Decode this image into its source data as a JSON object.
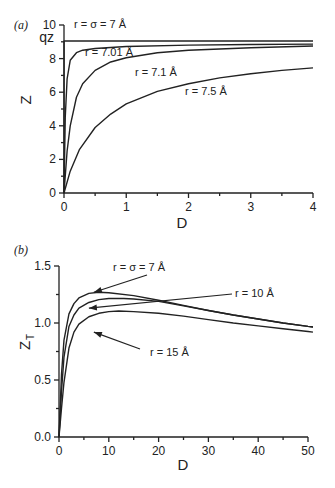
{
  "chart_data": [
    {
      "type": "line",
      "panel_label": "(a)",
      "title": "",
      "xlabel": "D",
      "ylabel": "Z",
      "xlim": [
        0,
        4
      ],
      "ylim": [
        0,
        10
      ],
      "xticks": [
        "0",
        "1",
        "2",
        "3",
        "4"
      ],
      "yticks": [
        "0",
        "2",
        "4",
        "6",
        "8",
        "10"
      ],
      "extra_ytick": {
        "label": "qz",
        "value": 9.05
      },
      "grid": false,
      "series": [
        {
          "name": "r = σ = 7 Å",
          "x": [
            0,
            0.001,
            4
          ],
          "y": [
            0,
            9.05,
            9.05
          ]
        },
        {
          "name": "r = 7.01 Å",
          "x": [
            0,
            0.02,
            0.05,
            0.1,
            0.2,
            0.3,
            0.5,
            1,
            2,
            3,
            4
          ],
          "y": [
            0,
            4.5,
            6.8,
            7.9,
            8.35,
            8.5,
            8.6,
            8.72,
            8.8,
            8.84,
            8.86
          ]
        },
        {
          "name": "r = 7.1 Å",
          "x": [
            0,
            0.05,
            0.1,
            0.2,
            0.3,
            0.5,
            0.75,
            1,
            1.5,
            2,
            3,
            4
          ],
          "y": [
            0,
            2.5,
            4.0,
            5.7,
            6.5,
            7.3,
            7.8,
            8.05,
            8.35,
            8.5,
            8.65,
            8.75
          ]
        },
        {
          "name": "r = 7.5 Å",
          "x": [
            0,
            0.1,
            0.25,
            0.5,
            0.75,
            1,
            1.5,
            2,
            2.5,
            3,
            3.5,
            4
          ],
          "y": [
            0,
            1.3,
            2.6,
            3.9,
            4.7,
            5.3,
            6.05,
            6.5,
            6.85,
            7.1,
            7.3,
            7.45
          ]
        }
      ],
      "annotations": [
        {
          "text": "r = σ = 7 Å",
          "series": 0
        },
        {
          "text": "r = 7.01 Å",
          "series": 1
        },
        {
          "text": "r = 7.1 Å",
          "series": 2
        },
        {
          "text": "r = 7.5 Å",
          "series": 3
        }
      ]
    },
    {
      "type": "line",
      "panel_label": "(b)",
      "title": "",
      "xlabel": "D",
      "ylabel": "Z_T",
      "ylabel_main": "Z",
      "ylabel_sub": "T",
      "xlim": [
        0,
        50
      ],
      "ylim": [
        0,
        1.5
      ],
      "xticks": [
        "0",
        "10",
        "20",
        "30",
        "40",
        "50"
      ],
      "yticks": [
        "0.0",
        "0.5",
        "1.0",
        "1.5"
      ],
      "grid": false,
      "series": [
        {
          "name": "r = σ = 7 Å",
          "x": [
            0,
            0.5,
            1,
            2,
            3,
            4,
            6,
            8,
            10,
            15,
            20,
            25,
            30,
            35,
            40,
            45,
            50,
            51
          ],
          "y": [
            0,
            0.55,
            0.85,
            1.08,
            1.17,
            1.22,
            1.26,
            1.27,
            1.265,
            1.24,
            1.2,
            1.155,
            1.11,
            1.07,
            1.035,
            1.0,
            0.97,
            0.965
          ]
        },
        {
          "name": "r = 10 Å",
          "x": [
            0,
            0.5,
            1,
            2,
            3,
            4,
            6,
            8,
            10,
            13,
            15,
            20,
            25,
            30,
            35,
            40,
            45,
            50,
            51
          ],
          "y": [
            0,
            0.4,
            0.7,
            0.97,
            1.07,
            1.13,
            1.18,
            1.205,
            1.215,
            1.215,
            1.21,
            1.19,
            1.15,
            1.11,
            1.07,
            1.035,
            1.0,
            0.97,
            0.965
          ]
        },
        {
          "name": "r = 15 Å",
          "x": [
            0,
            0.5,
            1,
            2,
            3,
            4,
            6,
            8,
            10,
            12,
            15,
            20,
            25,
            30,
            35,
            40,
            45,
            50,
            51
          ],
          "y": [
            0,
            0.25,
            0.48,
            0.78,
            0.92,
            0.99,
            1.055,
            1.085,
            1.1,
            1.105,
            1.1,
            1.085,
            1.06,
            1.03,
            1.0,
            0.975,
            0.95,
            0.925,
            0.92
          ]
        }
      ],
      "annotations": [
        {
          "text": "r = σ = 7 Å",
          "series": 0,
          "arrow_to": [
            7,
            1.27
          ]
        },
        {
          "text": "r = 10 Å",
          "series": 1,
          "arrow_to": [
            6,
            1.13
          ]
        },
        {
          "text": "r = 15 Å",
          "series": 2,
          "arrow_to": [
            7,
            0.92
          ]
        }
      ]
    }
  ]
}
